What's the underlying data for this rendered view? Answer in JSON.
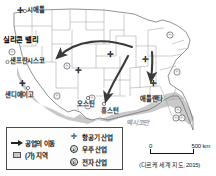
{
  "figure": {
    "type": "thematic-map",
    "country_outline": "United States (contiguous 48 states)"
  },
  "city_labels": [
    {
      "name": "시애틀",
      "symbol": "aircraft",
      "x": 10,
      "y": 8
    },
    {
      "name": "샌프란시스코",
      "symbol": "city-dot",
      "x": 5,
      "y": 58
    },
    {
      "name": "샌디에이고",
      "symbol": "aircraft",
      "x": 6,
      "y": 92
    },
    {
      "name": "오스틴",
      "symbol": "city-dot",
      "x": 78,
      "y": 101
    },
    {
      "name": "휴스턴",
      "symbol": "city-dot",
      "x": 103,
      "y": 108
    },
    {
      "name": "애틀랜타",
      "symbol": "aircraft",
      "x": 141,
      "y": 96
    }
  ],
  "region_labels": [
    {
      "name": "실리콘 밸리",
      "x": 4,
      "y": 39
    }
  ],
  "ocean_labels": [
    {
      "name": "멕시코만",
      "x": 126,
      "y": 121
    }
  ],
  "legend": {
    "items_left": [
      {
        "symbol": "arrow",
        "label": "공업의 이동"
      },
      {
        "symbol": "shaded-box",
        "label": "(가) 지역"
      }
    ],
    "items_right": [
      {
        "symbol": "plane",
        "marker": "✛",
        "label": "항공기 산업"
      },
      {
        "symbol": "circled-a",
        "marker": "ⓐ",
        "label": "우주 산업"
      },
      {
        "symbol": "circled-b",
        "marker": "ⓑ",
        "label": "전자 산업"
      }
    ]
  },
  "scale": {
    "start": "0",
    "end": "500 km"
  },
  "source": "(디르케 세계 지도, 2015)",
  "colors": {
    "sunbelt_fill": "#c6c6c6",
    "state_line": "#9a9a9a",
    "coast_line": "#6d6d6d",
    "arrow": "#3a3a3a",
    "ocean_text": "#9aa6b2"
  }
}
